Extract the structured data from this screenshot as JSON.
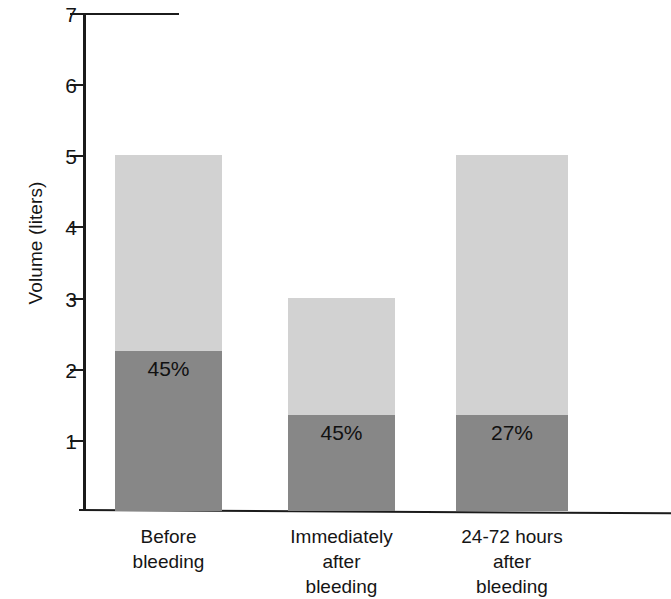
{
  "chart_data": {
    "type": "bar",
    "subtype": "stacked",
    "title": "",
    "xlabel": "",
    "ylabel": "Volume (liters)",
    "ylim": [
      0,
      7
    ],
    "yticks": [
      1,
      2,
      3,
      4,
      5,
      6,
      7
    ],
    "ytick_labels": [
      "1",
      "2",
      "3",
      "4",
      "5",
      "6",
      "7"
    ],
    "grid": false,
    "legend": null,
    "categories": [
      "Before bleeding",
      "Immediately after bleeding",
      "24-72 hours after bleeding"
    ],
    "category_lines": [
      [
        "Before",
        "bleeding"
      ],
      [
        "Immediately",
        "after",
        "bleeding"
      ],
      [
        "24-72 hours",
        "after",
        "bleeding"
      ]
    ],
    "series": [
      {
        "name": "red cell volume",
        "color": "#878787",
        "values": [
          2.25,
          1.35,
          1.35
        ]
      },
      {
        "name": "plasma volume",
        "color": "#d2d2d2",
        "values": [
          2.75,
          1.65,
          3.65
        ]
      }
    ],
    "totals": [
      5.0,
      3.0,
      5.0
    ],
    "annotations": [
      {
        "text": "45%",
        "category": "Before bleeding",
        "value": 2.25
      },
      {
        "text": "45%",
        "category": "Immediately after bleeding",
        "value": 1.35
      },
      {
        "text": "27%",
        "category": "24-72 hours after bleeding",
        "value": 1.35
      }
    ],
    "bar_labels": [
      "45%",
      "45%",
      "27%"
    ],
    "colors": {
      "light_gray": "#d2d2d2",
      "dark_gray": "#878787",
      "axis": "#1b1b1b",
      "background": "#ffffff"
    }
  }
}
